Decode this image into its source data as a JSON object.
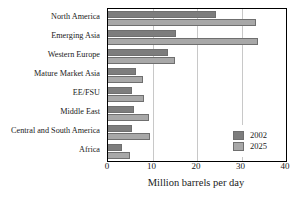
{
  "chart_data": {
    "type": "bar",
    "orientation": "horizontal",
    "title": "",
    "xlabel": "Million barrels per day",
    "ylabel": "",
    "xlim": [
      0,
      40
    ],
    "xticks": [
      0,
      10,
      20,
      30,
      40
    ],
    "xtick_labels": [
      "0",
      "10",
      "20",
      "30",
      "40"
    ],
    "grid": true,
    "grid_axis": "x",
    "legend_position": "bottom-right",
    "categories": [
      "North America",
      "Emerging Asia",
      "Western Europe",
      "Mature Market Asia",
      "EE/FSU",
      "Middle East",
      "Central and South America",
      "Africa"
    ],
    "series": [
      {
        "name": "2002",
        "color": "#7d7d7d",
        "values": [
          24.3,
          15.3,
          13.5,
          6.3,
          5.5,
          5.9,
          5.5,
          3.1
        ]
      },
      {
        "name": "2025",
        "color": "#a8a8a8",
        "values": [
          33.3,
          33.7,
          15.1,
          7.8,
          8.1,
          9.2,
          9.4,
          5.0
        ]
      }
    ]
  },
  "legend": {
    "entries": [
      {
        "label": "2002",
        "color": "#7d7d7d"
      },
      {
        "label": "2025",
        "color": "#a8a8a8"
      }
    ]
  },
  "axis": {
    "x_title": "Million barrels per day"
  },
  "colors": {
    "series_2002": "#7d7d7d",
    "series_2025": "#a8a8a8",
    "frame": "#000000",
    "gridline": "#c8c8c8",
    "background": "#ffffff"
  }
}
